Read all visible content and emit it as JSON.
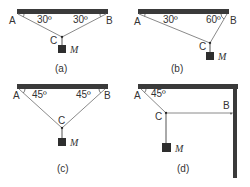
{
  "colors": {
    "bar": "#3a3a3a",
    "string": "#8a8a8a",
    "mass": "#2e2e2e",
    "text": "#333333"
  },
  "mass_label": "M",
  "panels": [
    {
      "caption": "(a)",
      "points": {
        "A": "A",
        "B": "B",
        "C": "C"
      },
      "angles": {
        "A": "30º",
        "B": "30º"
      }
    },
    {
      "caption": "(b)",
      "points": {
        "A": "A",
        "B": "B",
        "C": "C"
      },
      "angles": {
        "A": "30º",
        "B": "60º"
      }
    },
    {
      "caption": "(c)",
      "points": {
        "A": "A",
        "B": "B",
        "C": "C"
      },
      "angles": {
        "A": "45º",
        "B": "45º"
      }
    },
    {
      "caption": "(d)",
      "points": {
        "A": "A",
        "B": "B",
        "C": "C"
      },
      "angles": {
        "A": "45º"
      }
    }
  ]
}
